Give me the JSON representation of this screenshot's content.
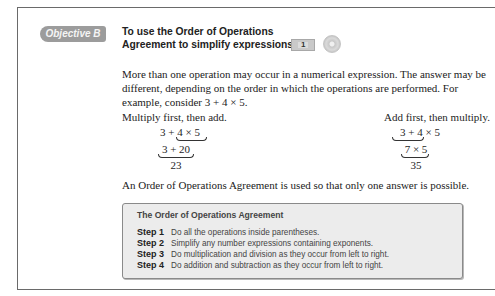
{
  "objective": {
    "badge": "Objective B",
    "title_line1": "To use the Order of Operations",
    "title_line2": "Agreement to simplify expressions",
    "video_icon_number": "1"
  },
  "intro_paragraph": "More than one operation may occur in a numerical expression. The answer may be different, depending on the order in which the operations are performed. For example, consider 3 + 4 × 5.",
  "examples": {
    "left": {
      "label": "Multiply first, then add.",
      "line1_a": "3 + ",
      "line1_b": "4 × 5",
      "line2": "3 + 20",
      "result": "23"
    },
    "right": {
      "label": "Add first, then multiply.",
      "line1_a": "3 + 4",
      "line1_b": " × 5",
      "line2": "7 × 5",
      "result": "35"
    }
  },
  "summary_paragraph": "An Order of Operations Agreement is used so that only one answer is possible.",
  "agreement_box": {
    "title": "The Order of Operations Agreement",
    "steps": [
      {
        "label": "Step 1",
        "text": "Do all the operations inside parentheses."
      },
      {
        "label": "Step 2",
        "text": "Simplify any number expressions containing exponents."
      },
      {
        "label": "Step 3",
        "text": "Do multiplication and division as they occur from left to right."
      },
      {
        "label": "Step 4",
        "text": "Do addition and subtraction as they occur from left to right."
      }
    ]
  }
}
